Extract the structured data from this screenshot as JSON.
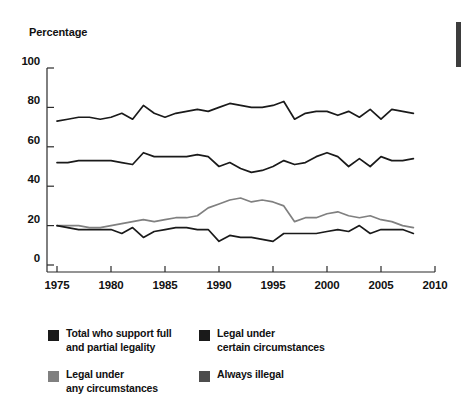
{
  "axes": {
    "y_axis_title": "Percentage",
    "y_ticks": [
      "0",
      "20",
      "40",
      "60",
      "80",
      "100"
    ],
    "x_ticks": [
      "1975",
      "1980",
      "1985",
      "1990",
      "1995",
      "2000",
      "2005",
      "2010"
    ]
  },
  "legend": {
    "items": [
      {
        "label": "Total who support full\nand partial legality",
        "color": "#1a1a1a",
        "swatch": "legend-swatch-total"
      },
      {
        "label": "Legal under\ncertain circumstances",
        "color": "#1a1a1a",
        "swatch": "legend-swatch-certain"
      },
      {
        "label": "Legal under\nany circumstances",
        "color": "#808080",
        "swatch": "legend-swatch-any"
      },
      {
        "label": "Always illegal",
        "color": "#4d4d4d",
        "swatch": "legend-swatch-illegal"
      }
    ]
  },
  "chart_data": {
    "type": "line",
    "title": "",
    "xlabel": "",
    "ylabel": "Percentage",
    "xlim": [
      1975,
      2010
    ],
    "ylim": [
      0,
      100
    ],
    "ytick_values": [
      0,
      20,
      40,
      60,
      80,
      100
    ],
    "xtick_values": [
      1975,
      1980,
      1985,
      1990,
      1995,
      2000,
      2005,
      2010
    ],
    "grid": false,
    "legend_position": "below-left",
    "x": [
      1975,
      1976,
      1977,
      1978,
      1979,
      1980,
      1981,
      1982,
      1983,
      1984,
      1985,
      1986,
      1987,
      1988,
      1989,
      1990,
      1991,
      1992,
      1993,
      1994,
      1995,
      1996,
      1997,
      1998,
      1999,
      2000,
      2001,
      2002,
      2003,
      2004,
      2005,
      2006,
      2007,
      2008
    ],
    "series": [
      {
        "name": "Total who support full and partial legality",
        "color": "#1a1a1a",
        "values": [
          73,
          74,
          75,
          75,
          74,
          75,
          77,
          74,
          81,
          77,
          75,
          77,
          78,
          79,
          78,
          80,
          82,
          81,
          80,
          80,
          81,
          83,
          74,
          77,
          78,
          78,
          76,
          78,
          75,
          79,
          74,
          79,
          78,
          77
        ]
      },
      {
        "name": "Legal under certain circumstances",
        "color": "#1a1a1a",
        "values": [
          52,
          52,
          53,
          53,
          53,
          53,
          52,
          51,
          57,
          55,
          55,
          55,
          55,
          56,
          55,
          50,
          52,
          49,
          47,
          48,
          50,
          53,
          51,
          52,
          55,
          57,
          55,
          50,
          54,
          50,
          55,
          53,
          53,
          54
        ]
      },
      {
        "name": "Legal under any circumstances",
        "color": "#808080",
        "values": [
          20,
          20,
          20,
          19,
          19,
          20,
          21,
          22,
          23,
          22,
          23,
          24,
          24,
          25,
          29,
          31,
          33,
          34,
          32,
          33,
          32,
          30,
          22,
          24,
          24,
          26,
          27,
          25,
          24,
          25,
          23,
          22,
          20,
          19
        ]
      },
      {
        "name": "Always illegal",
        "color": "#1a1a1a",
        "values": [
          20,
          19,
          18,
          18,
          18,
          18,
          16,
          19,
          14,
          17,
          18,
          19,
          19,
          18,
          18,
          12,
          15,
          14,
          14,
          13,
          12,
          16,
          16,
          16,
          16,
          17,
          18,
          17,
          20,
          16,
          18,
          18,
          18,
          16
        ]
      }
    ]
  }
}
